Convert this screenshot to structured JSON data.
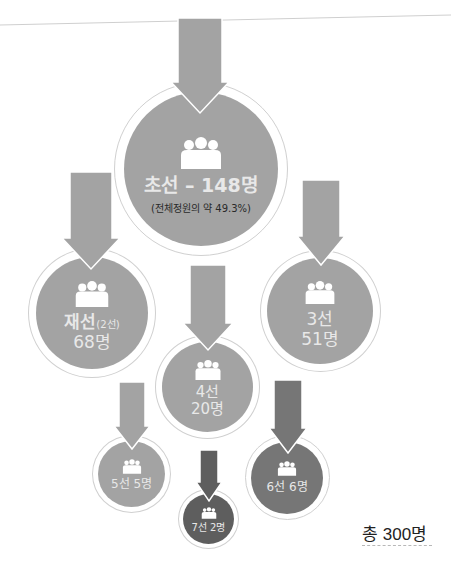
{
  "colors": {
    "light_fill": "#a3a3a3",
    "mid_fill": "#9a9a9a",
    "dark_fill": "#767676",
    "darkest_fill": "#5e5e5e",
    "ring": "#d0d0d0",
    "text_light": "#e8e8e8",
    "text_dark": "#2a2a2a"
  },
  "icons": {
    "group": "people-group-icon",
    "arrow": "down-arrow-icon"
  },
  "nodes": [
    {
      "id": "first-term",
      "label": "초선 – 148명",
      "sub": "(전체정원의 약 49.3%)",
      "count": 148,
      "term": "초선"
    },
    {
      "id": "second-term",
      "label": "재선",
      "label_small": "(2선)",
      "label2": "68명",
      "count": 68,
      "term": "재선(2선)"
    },
    {
      "id": "third-term",
      "label": "3선",
      "label2": "51명",
      "count": 51,
      "term": "3선"
    },
    {
      "id": "fourth-term",
      "label": "4선",
      "label2": "20명",
      "count": 20,
      "term": "4선"
    },
    {
      "id": "fifth-term",
      "label": "5선 5명",
      "count": 5,
      "term": "5선"
    },
    {
      "id": "sixth-term",
      "label": "6선 6명",
      "count": 6,
      "term": "6선"
    },
    {
      "id": "seventh-term",
      "label": "7선 2명",
      "count": 2,
      "term": "7선"
    }
  ],
  "total": {
    "label": "총 300명",
    "count": 300
  }
}
